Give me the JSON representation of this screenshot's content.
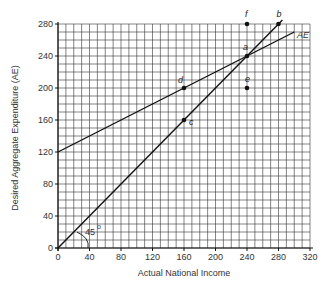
{
  "chart_data": {
    "type": "line",
    "title": "",
    "xlabel": "Actual National Income",
    "ylabel": "Desired Aggregate Expenditure (AE)",
    "xlim": [
      0,
      320
    ],
    "ylim": [
      0,
      280
    ],
    "grid": true,
    "grid_minor_step": 10,
    "x_ticks": [
      0,
      40,
      80,
      120,
      160,
      200,
      240,
      280,
      320
    ],
    "y_ticks": [
      0,
      40,
      80,
      120,
      160,
      200,
      240,
      280
    ],
    "series": [
      {
        "name": "AE",
        "x": [
          0,
          300
        ],
        "y": [
          120,
          270
        ],
        "label": "AE"
      },
      {
        "name": "45° line",
        "x": [
          0,
          285
        ],
        "y": [
          0,
          285
        ],
        "label": "45°"
      }
    ],
    "points": [
      {
        "label": "a",
        "x": 240,
        "y": 240
      },
      {
        "label": "b",
        "x": 280,
        "y": 280
      },
      {
        "label": "c",
        "x": 160,
        "y": 160
      },
      {
        "label": "d",
        "x": 160,
        "y": 200
      },
      {
        "label": "e",
        "x": 240,
        "y": 200
      },
      {
        "label": "f",
        "x": 240,
        "y": 280
      }
    ],
    "annotations": [
      {
        "text": "45",
        "superscript": "o",
        "x": 40,
        "y": 20
      },
      {
        "text": "AE",
        "x": 300,
        "y": 270
      }
    ]
  },
  "labels": {
    "x_axis": "Actual National Income",
    "y_axis": "Desired Aggregate Expenditure (AE)",
    "angle": "45",
    "angle_unit": "o",
    "ae_curve": "AE",
    "pt_a": "a",
    "pt_b": "b",
    "pt_c": "c",
    "pt_d": "d",
    "pt_e": "e",
    "pt_f": "f"
  },
  "ticks": {
    "x": [
      "0",
      "40",
      "80",
      "120",
      "160",
      "200",
      "240",
      "280",
      "320"
    ],
    "y": [
      "0",
      "40",
      "80",
      "120",
      "160",
      "200",
      "240",
      "280"
    ]
  }
}
